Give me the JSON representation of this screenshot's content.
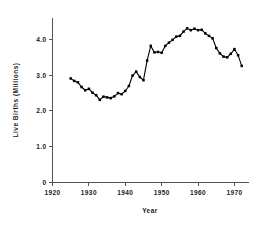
{
  "chart_data": {
    "type": "line",
    "title": "",
    "subtitle": "",
    "xlabel": "Year",
    "ylabel": "Live Births (Millions)",
    "xlim": [
      1920,
      1974
    ],
    "ylim": [
      0,
      4.6
    ],
    "xticks": [
      "1920",
      "1930",
      "1940",
      "1950",
      "1960",
      "1970"
    ],
    "xtick_values": [
      1920,
      1930,
      1940,
      1950,
      1960,
      1970
    ],
    "yticks": [
      "0",
      "1.0",
      "2.0",
      "3.0",
      "4.0"
    ],
    "ytick_values": [
      0,
      1.0,
      2.0,
      3.0,
      4.0
    ],
    "grid": false,
    "legend": "none",
    "markers": "filled-square",
    "x": [
      1925,
      1926,
      1927,
      1928,
      1929,
      1930,
      1931,
      1932,
      1933,
      1934,
      1935,
      1936,
      1937,
      1938,
      1939,
      1940,
      1941,
      1942,
      1943,
      1944,
      1945,
      1946,
      1947,
      1948,
      1949,
      1950,
      1951,
      1952,
      1953,
      1954,
      1955,
      1956,
      1957,
      1958,
      1959,
      1960,
      1961,
      1962,
      1963,
      1964,
      1965,
      1966,
      1967,
      1968,
      1969,
      1970,
      1971,
      1972
    ],
    "values": [
      2.91,
      2.84,
      2.8,
      2.67,
      2.58,
      2.62,
      2.51,
      2.44,
      2.31,
      2.4,
      2.38,
      2.36,
      2.41,
      2.5,
      2.47,
      2.56,
      2.7,
      2.99,
      3.1,
      2.95,
      2.86,
      3.41,
      3.82,
      3.64,
      3.65,
      3.63,
      3.82,
      3.91,
      3.99,
      4.08,
      4.1,
      4.22,
      4.31,
      4.26,
      4.3,
      4.26,
      4.27,
      4.17,
      4.1,
      4.03,
      3.76,
      3.61,
      3.52,
      3.5,
      3.6,
      3.73,
      3.56,
      3.26
    ],
    "series": [
      {
        "name": "Live Births",
        "values": [
          2.91,
          2.84,
          2.8,
          2.67,
          2.58,
          2.62,
          2.51,
          2.44,
          2.31,
          2.4,
          2.38,
          2.36,
          2.41,
          2.5,
          2.47,
          2.56,
          2.7,
          2.99,
          3.1,
          2.95,
          2.86,
          3.41,
          3.82,
          3.64,
          3.65,
          3.63,
          3.82,
          3.91,
          3.99,
          4.08,
          4.1,
          4.22,
          4.31,
          4.26,
          4.3,
          4.26,
          4.27,
          4.17,
          4.1,
          4.03,
          3.76,
          3.61,
          3.52,
          3.5,
          3.6,
          3.73,
          3.56,
          3.26
        ]
      }
    ]
  }
}
